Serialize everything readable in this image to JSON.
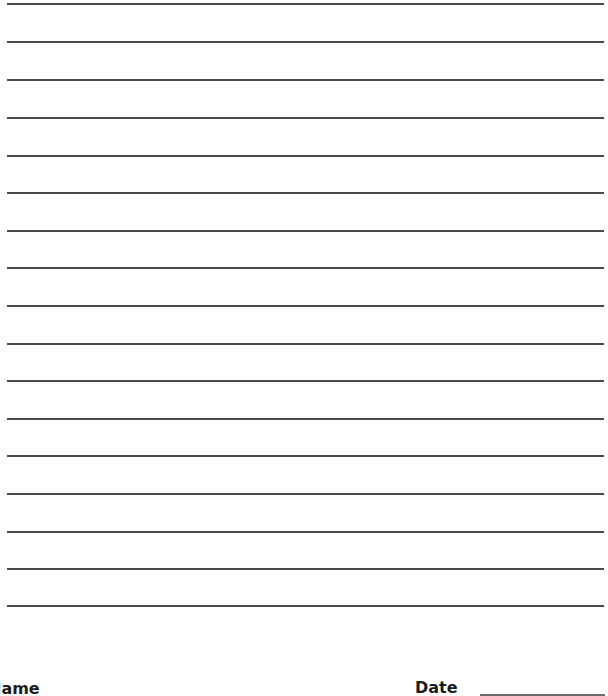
{
  "page": {
    "type": "lined-writing-paper",
    "line_count": 17,
    "line_color": "#4a4a4a",
    "line_positions_y": [
      3,
      41,
      79,
      117,
      155,
      192,
      230,
      267,
      305,
      343,
      380,
      418,
      455,
      493,
      531,
      568,
      605
    ]
  },
  "footer": {
    "name_label": "Name",
    "date_label": "Date"
  }
}
